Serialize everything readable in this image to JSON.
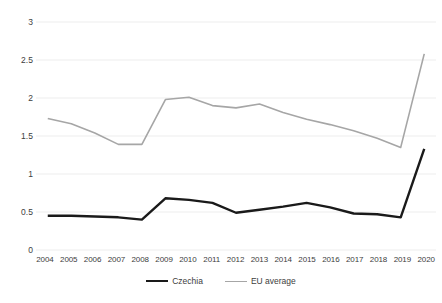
{
  "chart_data": {
    "type": "line",
    "title": "",
    "xlabel": "",
    "ylabel": "",
    "ylim": [
      0,
      3
    ],
    "yticks": [
      0,
      0.5,
      1,
      1.5,
      2,
      2.5,
      3
    ],
    "ytick_labels": [
      "0",
      "0.5",
      "1",
      "1.5",
      "2",
      "2.5",
      "3"
    ],
    "grid": true,
    "legend_position": "bottom",
    "categories": [
      2004,
      2005,
      2006,
      2007,
      2008,
      2009,
      2010,
      2011,
      2012,
      2013,
      2014,
      2015,
      2016,
      2017,
      2018,
      2019,
      2020
    ],
    "xtick_labels": [
      "2004",
      "2005",
      "2006",
      "2007",
      "2008",
      "2009",
      "2010",
      "2011",
      "2012",
      "2013",
      "2014",
      "2015",
      "2016",
      "2017",
      "2018",
      "2019",
      "2020"
    ],
    "series": [
      {
        "name": "Czechia",
        "color": "#1a1a1a",
        "width": 2.4,
        "values": [
          0.45,
          0.45,
          0.44,
          0.43,
          0.4,
          0.68,
          0.66,
          0.62,
          0.49,
          0.53,
          0.57,
          0.62,
          0.56,
          0.48,
          0.47,
          0.43,
          1.33
        ]
      },
      {
        "name": "EU average",
        "color": "#a6a6a6",
        "width": 1.6,
        "values": [
          1.73,
          1.66,
          1.54,
          1.39,
          1.39,
          1.98,
          2.01,
          1.9,
          1.87,
          1.92,
          1.81,
          1.72,
          1.65,
          1.57,
          1.47,
          1.35,
          2.58
        ]
      }
    ]
  },
  "legend": {
    "items": [
      {
        "label": "Czechia"
      },
      {
        "label": "EU average"
      }
    ]
  }
}
